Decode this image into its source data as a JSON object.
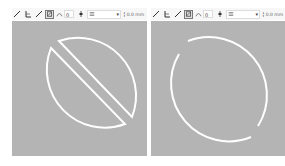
{
  "colors": {
    "canvas_bg": "#b4b4b4",
    "toolbar_bg": "#f7f7f7",
    "stroke": "#ffffff"
  },
  "panels": [
    {
      "id": "left",
      "toolbar": {
        "tools": [
          "line-tool",
          "angle-tool",
          "freehand-tool"
        ],
        "auto_close_selected": true,
        "tolerance_value": "0",
        "dropdown_value": "",
        "size_value": "0.0 mm"
      },
      "canvas": {
        "description": "Circle split diagonally into two half-discs separated by a gap"
      }
    },
    {
      "id": "right",
      "toolbar": {
        "tools": [
          "line-tool",
          "angle-tool",
          "freehand-tool"
        ],
        "auto_close_selected": true,
        "tolerance_value": "0",
        "dropdown_value": "",
        "size_value": "0.0 mm"
      },
      "canvas": {
        "description": "Circle outline broken into two open arcs with gaps"
      }
    }
  ]
}
